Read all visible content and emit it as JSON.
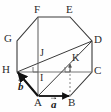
{
  "figure": {
    "shape": "regular-octagon",
    "stroke_color": "#3a3a3a",
    "accent_color": "#111111",
    "dashed_color": "#8a8a8a",
    "background": "#fefefe",
    "vertices": [
      {
        "name": "A",
        "label": "A",
        "x": 38,
        "y": 96,
        "label_x": 34,
        "label_y": 98
      },
      {
        "name": "B",
        "label": "B",
        "x": 70,
        "y": 96,
        "label_x": 69,
        "label_y": 98
      },
      {
        "name": "C",
        "label": "C",
        "x": 92,
        "y": 72,
        "label_x": 94,
        "label_y": 68
      },
      {
        "name": "D",
        "label": "D",
        "x": 92,
        "y": 41,
        "label_x": 94,
        "label_y": 37
      },
      {
        "name": "E",
        "label": "E",
        "x": 70,
        "y": 17,
        "label_x": 67,
        "label_y": 6
      },
      {
        "name": "F",
        "label": "F",
        "x": 38,
        "y": 17,
        "label_x": 35,
        "label_y": 6
      },
      {
        "name": "G",
        "label": "G",
        "x": 17,
        "y": 41,
        "label_x": 6,
        "label_y": 36
      },
      {
        "name": "H",
        "label": "H",
        "x": 17,
        "y": 72,
        "label_x": 4,
        "label_y": 67
      }
    ],
    "interior_points": [
      {
        "name": "I",
        "label": "I",
        "x": 38,
        "y": 72,
        "label_x": 40,
        "label_y": 74
      },
      {
        "name": "J",
        "label": "J",
        "x": 38,
        "y": 58,
        "label_x": 40,
        "label_y": 51
      },
      {
        "name": "K",
        "label": "K",
        "x": 70,
        "y": 65,
        "label_x": 72,
        "label_y": 57
      }
    ],
    "segments": [
      {
        "name": "edge-AB",
        "from": "A",
        "to": "B",
        "style": "solid"
      },
      {
        "name": "edge-BC",
        "from": "B",
        "to": "C",
        "style": "solid"
      },
      {
        "name": "edge-CD",
        "from": "C",
        "to": "D",
        "style": "solid"
      },
      {
        "name": "edge-DE",
        "from": "D",
        "to": "E",
        "style": "solid"
      },
      {
        "name": "edge-EF",
        "from": "E",
        "to": "F",
        "style": "solid"
      },
      {
        "name": "edge-FG",
        "from": "F",
        "to": "G",
        "style": "solid"
      },
      {
        "name": "edge-GH",
        "from": "G",
        "to": "H",
        "style": "solid"
      },
      {
        "name": "edge-HA",
        "from": "H",
        "to": "A",
        "style": "solid"
      },
      {
        "name": "chord-HC",
        "from": "H",
        "to": "C",
        "style": "solid"
      },
      {
        "name": "chord-HD",
        "from": "H",
        "to": "D",
        "style": "solid"
      },
      {
        "name": "chord-AD",
        "from": "A",
        "to": "D",
        "style": "solid"
      },
      {
        "name": "chord-FA",
        "from": "F",
        "to": "A",
        "style": "solid"
      },
      {
        "name": "drop-KB",
        "from": "K",
        "to": "B",
        "style": "dashed"
      }
    ],
    "right_angle_marks": [
      {
        "name": "right-angle-at-I",
        "x": 38,
        "y": 72,
        "facing": "left-up"
      },
      {
        "name": "right-angle-at-B-foot",
        "x": 70,
        "y": 72,
        "facing": "left-up"
      }
    ],
    "vectors": [
      {
        "name": "vector-a",
        "label": "a",
        "from": "A",
        "to": "B",
        "label_x": 51,
        "label_y": 100,
        "description": "horizontal vector a from A to B"
      },
      {
        "name": "vector-b",
        "label": "b",
        "from": "A",
        "to": "H",
        "label_x": 19,
        "label_y": 82,
        "description": "vector b from A to H"
      },
      {
        "name": "vector-k-arrow",
        "label": "",
        "from": "K-foot",
        "to": "K",
        "label_x": 0,
        "label_y": 0,
        "description": "short upward arrow at K along dashed line"
      }
    ]
  }
}
